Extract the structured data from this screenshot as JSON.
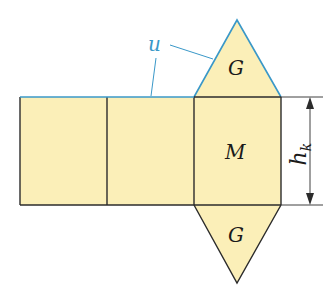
{
  "diagram": {
    "colors": {
      "fill": "#fbefb8",
      "edge": "#2b2b2b",
      "highlight": "#3a98c8",
      "label": "#1a1a1a"
    },
    "labels": {
      "top_base": "G",
      "bottom_base": "G",
      "lateral": "M",
      "perimeter": "u",
      "height_main": "h",
      "height_sub": "k"
    }
  }
}
